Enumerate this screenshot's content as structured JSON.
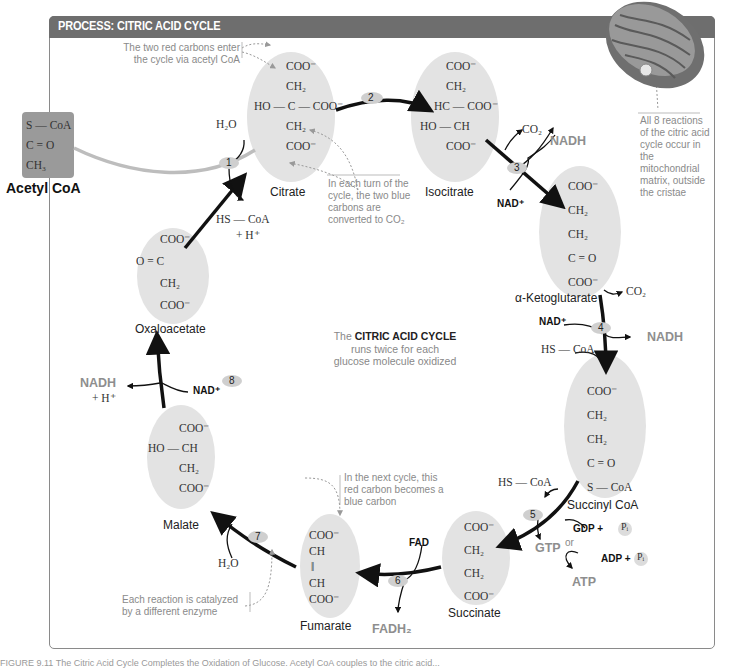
{
  "header": {
    "title": "PROCESS: CITRIC ACID CYCLE"
  },
  "colors": {
    "header_bg": "#6e6e6e",
    "oval_fill": "#e3e3e3",
    "step_badge": "#cfcfcf",
    "product_text": "#8e8e8e",
    "note_text": "#8a8a8a",
    "red_carbon": "#c8c8c8",
    "blue_carbon": "#bdbdbd"
  },
  "acetyl_coa": {
    "name": "Acetyl CoA",
    "structure": [
      "S — CoA",
      "C = O",
      "CH₃"
    ]
  },
  "center": {
    "line1_prefix": "The",
    "line1_bold": "CITRIC ACID CYCLE",
    "line2": "runs twice for each",
    "line3": "glucose molecule oxidized"
  },
  "notes": {
    "red_carbons": "The two red carbons enter the cycle via acetyl CoA",
    "blue_carbons": "In each turn of the cycle, the two blue carbons are converted to CO₂",
    "mitochondria": "All 8 reactions of the citric acid cycle occur in the mitochondrial matrix, outside the cristae",
    "next_cycle": "In the next cycle, this red carbon becomes a blue carbon",
    "enzyme": "Each reaction is catalyzed by a different enzyme"
  },
  "molecules": [
    {
      "name": "Citrate",
      "structure": [
        "COO⁻",
        "CH₂",
        "HO — C — COO⁻",
        "CH₂",
        "COO⁻"
      ]
    },
    {
      "name": "Isocitrate",
      "structure": [
        "COO⁻",
        "CH₂",
        "HC — COO⁻",
        "HO — CH",
        "COO⁻"
      ]
    },
    {
      "name": "α-Ketoglutarate",
      "structure": [
        "COO⁻",
        "CH₂",
        "CH₂",
        "C = O",
        "COO⁻"
      ]
    },
    {
      "name": "Succinyl CoA",
      "structure": [
        "COO⁻",
        "CH₂",
        "CH₂",
        "C = O",
        "S — CoA"
      ]
    },
    {
      "name": "Succinate",
      "structure": [
        "COO⁻",
        "CH₂",
        "CH₂",
        "COO⁻"
      ]
    },
    {
      "name": "Fumarate",
      "structure": [
        "COO⁻",
        "CH",
        "‖",
        "CH",
        "COO⁻"
      ]
    },
    {
      "name": "Malate",
      "structure": [
        "COO⁻",
        "HO — CH",
        "CH₂",
        "COO⁻"
      ]
    },
    {
      "name": "Oxaloacetate",
      "structure": [
        "COO⁻",
        "O = C",
        "CH₂",
        "COO⁻"
      ]
    }
  ],
  "steps": [
    {
      "number": "1",
      "inputs": [
        "H₂O"
      ],
      "outputs": [
        "HS — CoA",
        "+ H⁺"
      ]
    },
    {
      "number": "2",
      "inputs": [],
      "outputs": []
    },
    {
      "number": "3",
      "inputs": [
        "NAD⁺"
      ],
      "outputs": [
        "CO₂",
        "NADH"
      ]
    },
    {
      "number": "4",
      "inputs": [
        "NAD⁺",
        "HS — CoA"
      ],
      "outputs": [
        "CO₂",
        "NADH"
      ]
    },
    {
      "number": "5",
      "inputs": [
        "GDP + Pᵢ",
        "ADP + Pᵢ"
      ],
      "outputs": [
        "HS — CoA",
        "GTP",
        "ATP"
      ],
      "or_label": "or"
    },
    {
      "number": "6",
      "inputs": [
        "FAD"
      ],
      "outputs": [
        "FADH₂"
      ]
    },
    {
      "number": "7",
      "inputs": [
        "H₂O"
      ],
      "outputs": []
    },
    {
      "number": "8",
      "inputs": [
        "NAD⁺"
      ],
      "outputs": [
        "NADH",
        "+ H⁺"
      ]
    }
  ],
  "labels": {
    "h2o": "H₂O",
    "hs_coa": "HS — CoA",
    "h_plus": "+ H⁺",
    "co2": "CO₂",
    "nadh": "NADH",
    "nad_plus": "NAD⁺",
    "gdp": "GDP +",
    "adp": "ADP +",
    "pi": "Pᵢ",
    "gtp": "GTP",
    "atp": "ATP",
    "or": "or",
    "fad": "FAD",
    "fadh2": "FADH₂"
  },
  "caption": "FIGURE 9.11 The Citric Acid Cycle Completes the Oxidation of Glucose. Acetyl CoA couples to the citric acid..."
}
